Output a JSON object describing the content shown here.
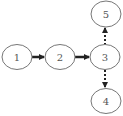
{
  "diagram": {
    "type": "flow-graph",
    "colors": {
      "stroke": "#777777",
      "arrow": "#222222",
      "label": "#555555",
      "background": "#ffffff"
    },
    "nodes": [
      {
        "id": "1",
        "label": "1",
        "cx": 17,
        "cy": 57
      },
      {
        "id": "2",
        "label": "2",
        "cx": 60,
        "cy": 57
      },
      {
        "id": "3",
        "label": "3",
        "cx": 105,
        "cy": 57
      },
      {
        "id": "5",
        "label": "5",
        "cx": 106,
        "cy": 14
      },
      {
        "id": "4",
        "label": "4",
        "cx": 106,
        "cy": 101
      }
    ],
    "edges": [
      {
        "from": "1",
        "to": "2",
        "style": "solid"
      },
      {
        "from": "2",
        "to": "3",
        "style": "solid"
      },
      {
        "from": "3",
        "to": "5",
        "style": "dotted"
      },
      {
        "from": "3",
        "to": "4",
        "style": "dotted"
      }
    ]
  }
}
